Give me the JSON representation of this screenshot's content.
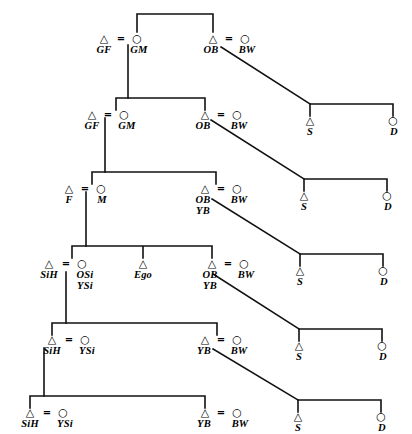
{
  "figure": {
    "symbols": {
      "male": "△",
      "female": "○",
      "marriage": "="
    },
    "ink_color": "#111111",
    "background_color": "#ffffff"
  },
  "generations": [
    {
      "id": "gen-1",
      "units": [
        {
          "id": "g1-u1",
          "husband": "GF",
          "wife": "GM",
          "married": true
        },
        {
          "id": "g1-u2",
          "husband": "OB",
          "wife": "BW",
          "married": true
        }
      ]
    },
    {
      "id": "gen-2",
      "units": [
        {
          "id": "g2-u1",
          "husband": "GF",
          "wife": "GM",
          "married": true
        },
        {
          "id": "g2-u2",
          "husband": "OB",
          "wife": "BW",
          "married": true
        },
        {
          "id": "g2-u3",
          "son": "S",
          "daughter": "D",
          "married": false
        }
      ]
    },
    {
      "id": "gen-3",
      "units": [
        {
          "id": "g3-u1",
          "husband": "F",
          "wife": "M",
          "married": true
        },
        {
          "id": "g3-u2",
          "husband": "OB\nYB",
          "wife": "BW",
          "married": true
        },
        {
          "id": "g3-u3",
          "son": "S",
          "daughter": "D",
          "married": false
        }
      ]
    },
    {
      "id": "gen-4",
      "units": [
        {
          "id": "g4-u1",
          "husband": "SiH",
          "wife": "OSi\nYSi",
          "married": true
        },
        {
          "id": "g4-u2",
          "ego": "Ego"
        },
        {
          "id": "g4-u3",
          "husband": "OB\nYB",
          "wife": "BW",
          "married": true
        },
        {
          "id": "g4-u4",
          "son": "S",
          "daughter": "D",
          "married": false
        }
      ]
    },
    {
      "id": "gen-5",
      "units": [
        {
          "id": "g5-u1",
          "husband": "SiH",
          "wife": "YSi",
          "married": true
        },
        {
          "id": "g5-u2",
          "husband": "YB",
          "wife": "BW",
          "married": true
        },
        {
          "id": "g5-u3",
          "son": "S",
          "daughter": "D",
          "married": false
        }
      ]
    },
    {
      "id": "gen-6",
      "units": [
        {
          "id": "g6-u1",
          "husband": "SiH",
          "wife": "YSi",
          "married": true
        },
        {
          "id": "g6-u2",
          "husband": "YB",
          "wife": "BW",
          "married": true
        },
        {
          "id": "g6-u3",
          "son": "S",
          "daughter": "D",
          "married": false
        }
      ]
    }
  ],
  "nodes": {
    "r1": {
      "gf_sym": "△",
      "gf_lab": "GF",
      "eq1": "=",
      "gm_sym": "○",
      "gm_lab": "GM",
      "ob_sym": "△",
      "ob_lab": "OB",
      "eq2": "=",
      "bw_sym": "○",
      "bw_lab": "BW"
    },
    "r2": {
      "gf_sym": "△",
      "gf_lab": "GF",
      "eq1": "=",
      "gm_sym": "○",
      "gm_lab": "GM",
      "ob_sym": "△",
      "ob_lab": "OB",
      "eq2": "=",
      "bw_sym": "○",
      "bw_lab": "BW",
      "s_sym": "△",
      "s_lab": "S",
      "d_sym": "○",
      "d_lab": "D"
    },
    "r3": {
      "f_sym": "△",
      "f_lab": "F",
      "eq1": "=",
      "m_sym": "○",
      "m_lab": "M",
      "ob_sym": "△",
      "ob_lab1": "OB",
      "ob_lab2": "YB",
      "eq2": "=",
      "bw_sym": "○",
      "bw_lab": "BW",
      "s_sym": "△",
      "s_lab": "S",
      "d_sym": "○",
      "d_lab": "D"
    },
    "r4": {
      "sih_sym": "△",
      "sih_lab": "SiH",
      "eq1": "=",
      "si_sym": "○",
      "si_lab1": "OSi",
      "si_lab2": "YSi",
      "ego_sym": "△",
      "ego_lab": "Ego",
      "ob_sym": "△",
      "ob_lab1": "OB",
      "ob_lab2": "YB",
      "eq2": "=",
      "bw_sym": "○",
      "bw_lab": "BW",
      "s_sym": "△",
      "s_lab": "S",
      "d_sym": "○",
      "d_lab": "D"
    },
    "r5": {
      "sih_sym": "△",
      "sih_lab": "SiH",
      "eq1": "=",
      "ysi_sym": "○",
      "ysi_lab": "YSi",
      "yb_sym": "△",
      "yb_lab": "YB",
      "eq2": "=",
      "bw_sym": "○",
      "bw_lab": "BW",
      "s_sym": "△",
      "s_lab": "S",
      "d_sym": "○",
      "d_lab": "D"
    },
    "r6": {
      "sih_sym": "△",
      "sih_lab": "SiH",
      "eq1": "=",
      "ysi_sym": "○",
      "ysi_lab": "YSi",
      "yb_sym": "△",
      "yb_lab": "YB",
      "eq2": "=",
      "bw_sym": "○",
      "bw_lab": "BW",
      "s_sym": "△",
      "s_lab": "S",
      "d_sym": "○",
      "d_lab": "D"
    }
  }
}
